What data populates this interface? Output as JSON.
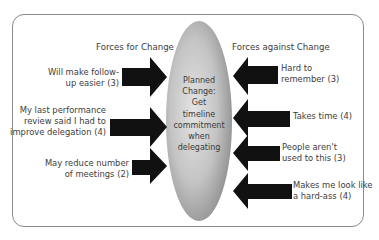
{
  "diagram": {
    "type": "force-field-analysis",
    "center": {
      "label_lines": [
        "Planned",
        "Change:",
        "Get",
        "timeline",
        "commitment",
        "when",
        "delegating"
      ]
    },
    "forces_for": {
      "heading": "Forces for Change",
      "items": [
        {
          "lines": [
            "Will make follow-",
            "up easier (3)"
          ],
          "weight": 3
        },
        {
          "lines": [
            "My last performance",
            "review said I had to",
            "improve delegation (4)"
          ],
          "weight": 4
        },
        {
          "lines": [
            "May reduce number",
            "of meetings (2)"
          ],
          "weight": 2
        }
      ]
    },
    "forces_against": {
      "heading": "Forces against Change",
      "items": [
        {
          "lines": [
            "Hard to",
            "remember (3)"
          ],
          "weight": 3
        },
        {
          "lines": [
            "Takes time (4)"
          ],
          "weight": 4
        },
        {
          "lines": [
            "People aren't",
            "used to this (3)"
          ],
          "weight": 3
        },
        {
          "lines": [
            "Makes me look like",
            "a hard-ass (4)"
          ],
          "weight": 4
        }
      ]
    },
    "colors": {
      "arrow": "#111111",
      "ellipse_light": "#e2e2e2",
      "ellipse_dark": "#8c8c8c",
      "border": "#8a8a8a",
      "text": "#3c3c3c"
    }
  }
}
